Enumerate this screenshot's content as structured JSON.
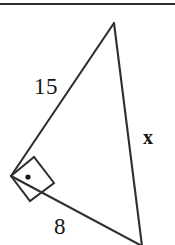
{
  "figure": {
    "name": "right-triangle-diagram",
    "background_color": "#ffffff",
    "stroke_color": "#2e2e2e",
    "text_color": "#141414"
  },
  "top_rule": {
    "name": "top-divider-rule",
    "color": "#2e2e2e"
  },
  "labels": {
    "leg_a": "15",
    "leg_b": "8",
    "hypotenuse": "x"
  },
  "geometry": {
    "apex": {
      "x": 114,
      "y": 23
    },
    "right_angle_vertex": {
      "x": 11,
      "y": 176
    },
    "bottom_vertex": {
      "x": 142,
      "y": 246
    },
    "right_angle_marker": {
      "name": "right-angle-square",
      "points": "11,176 34,157 54,183 30,201",
      "dot": {
        "x": 28,
        "y": 177,
        "r": 2.6
      }
    }
  }
}
